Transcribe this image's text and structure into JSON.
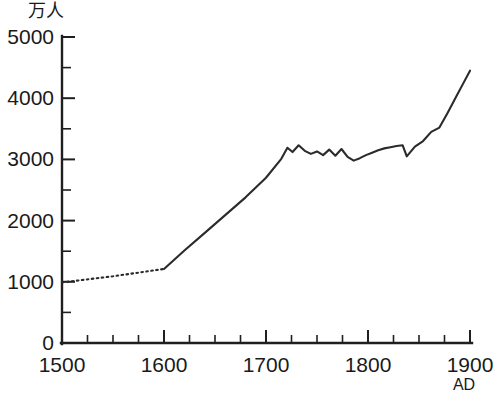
{
  "chart_data": {
    "type": "line",
    "title": "",
    "xlabel": "AD",
    "ylabel": "万人",
    "ylim": [
      0,
      5000
    ],
    "xlim": [
      1500,
      1900
    ],
    "grid": false,
    "legend": null,
    "y_unit_label": "万人",
    "x_era_label": "AD",
    "y_ticks": [
      0,
      1000,
      2000,
      3000,
      4000,
      5000
    ],
    "y_tick_labels": [
      "0",
      "1000",
      "2000",
      "3000",
      "4000",
      "5000"
    ],
    "y_minor_step": 500,
    "x_ticks": [
      1500,
      1600,
      1700,
      1800,
      1900
    ],
    "x_tick_labels": [
      "1500",
      "1600",
      "1700",
      "1800",
      "1900"
    ],
    "x_minor_step": 25,
    "series": [
      {
        "name": "estimated",
        "style": "dotted",
        "note": "推定（点線）",
        "x": [
          1500,
          1550,
          1600
        ],
        "values": [
          990,
          1090,
          1210
        ]
      },
      {
        "name": "observed",
        "style": "solid",
        "note": "実測（実線）",
        "x": [
          1600,
          1620,
          1640,
          1660,
          1680,
          1700,
          1715,
          1721,
          1726,
          1732,
          1738,
          1744,
          1750,
          1756,
          1762,
          1768,
          1774,
          1780,
          1786,
          1792,
          1798,
          1804,
          1810,
          1816,
          1822,
          1828,
          1834,
          1838,
          1846,
          1854,
          1862,
          1870,
          1878,
          1886,
          1893,
          1900
        ],
        "values": [
          1210,
          1510,
          1800,
          2090,
          2380,
          2700,
          3010,
          3190,
          3120,
          3230,
          3140,
          3090,
          3130,
          3070,
          3160,
          3060,
          3170,
          3040,
          2980,
          3020,
          3070,
          3110,
          3150,
          3180,
          3200,
          3220,
          3230,
          3050,
          3210,
          3300,
          3450,
          3520,
          3760,
          4010,
          4230,
          4450
        ]
      }
    ],
    "caption": ""
  }
}
